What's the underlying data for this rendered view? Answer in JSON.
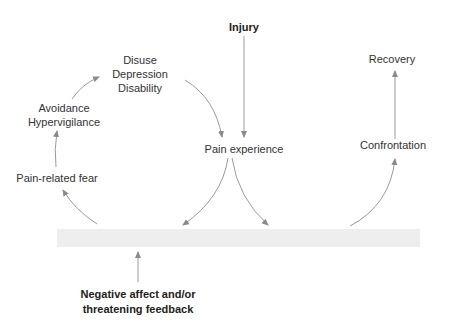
{
  "diagram": {
    "type": "fear-avoidance model flow diagram",
    "nodes": {
      "injury": "Injury",
      "pain_experience": "Pain experience",
      "disuse": [
        "Disuse",
        "Depression",
        "Disability"
      ],
      "avoidance": [
        "Avoidance",
        "Hypervigilance"
      ],
      "fear": "Pain-related fear",
      "recovery": "Recovery",
      "confrontation": "Confrontation",
      "negative_affect": [
        "Negative affect and/or",
        "threatening feedback"
      ]
    },
    "edges": [
      {
        "from": "Injury",
        "to": "Pain experience"
      },
      {
        "from": "Pain experience",
        "to": "Pain-related fear (via band)"
      },
      {
        "from": "Pain experience",
        "to": "Confrontation (via band)"
      },
      {
        "from": "Pain-related fear",
        "to": "Avoidance / Hypervigilance"
      },
      {
        "from": "Avoidance / Hypervigilance",
        "to": "Disuse / Depression / Disability"
      },
      {
        "from": "Disuse / Depression / Disability",
        "to": "Pain experience"
      },
      {
        "from": "Confrontation",
        "to": "Recovery"
      },
      {
        "from": "Negative affect and/or threatening feedback",
        "to": "band"
      }
    ],
    "colors": {
      "line": "#8a8a8a",
      "band": "#eeeeee",
      "text": "#333333"
    }
  }
}
